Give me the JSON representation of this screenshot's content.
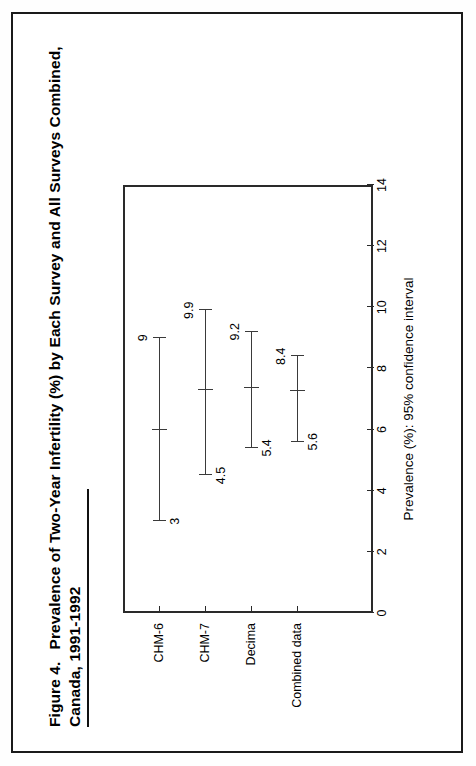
{
  "figure": {
    "number_label": "Figure 4.",
    "title_line1": "Prevalence of Two-Year Infertility (%) by Each Survey and All Surveys Combined,",
    "title_line2": "Canada, 1991-1992"
  },
  "chart_data": {
    "type": "scatter",
    "title": "Prevalence of Two-Year Infertility (%) by Each Survey and All Surveys Combined, Canada, 1991-1992",
    "orientation": "horizontal-error-bars",
    "xlabel": "Prevalence (%): 95% confidence interval",
    "ylabel": "",
    "xlim": [
      0,
      14
    ],
    "xticks": [
      0,
      2,
      4,
      6,
      8,
      10,
      12,
      14
    ],
    "xticklabels": [
      "0",
      "2",
      "4",
      "6",
      "8",
      "10",
      "12",
      "14"
    ],
    "grid": false,
    "legend": null,
    "categories": [
      "CHM-6",
      "CHM-7",
      "Decima",
      "Combined data"
    ],
    "series": [
      {
        "name": "95% confidence interval",
        "points": [
          {
            "category": "CHM-6",
            "low": 3,
            "high": 9,
            "estimate": 6.0,
            "low_label": "3",
            "high_label": "9"
          },
          {
            "category": "CHM-7",
            "low": 4.5,
            "high": 9.9,
            "estimate": 7.3,
            "low_label": "4.5",
            "high_label": "9.9"
          },
          {
            "category": "Decima",
            "low": 5.4,
            "high": 9.2,
            "estimate": 7.35,
            "low_label": "5.4",
            "high_label": "9.2"
          },
          {
            "category": "Combined data",
            "low": 5.6,
            "high": 8.4,
            "estimate": 7.25,
            "low_label": "5.6",
            "high_label": "8.4"
          }
        ]
      }
    ],
    "colors": {
      "line": "#3a3a3a",
      "frame": "#2a2a2a",
      "text": "#000000"
    }
  }
}
